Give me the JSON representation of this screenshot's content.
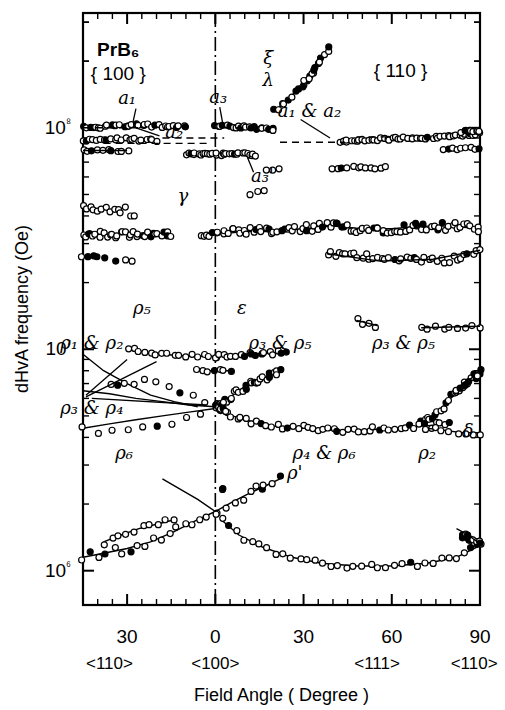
{
  "figure": {
    "title_material": "PrB₆",
    "plane_left": "{ 100 }",
    "plane_right": "{ 110 }",
    "xlabel": "Field Angle  ( Degree )",
    "ylabel": "dHvA frequency  (Oe)"
  },
  "chart_data": {
    "type": "scatter",
    "xlabel": "Field Angle  ( Degree )",
    "ylabel": "dHvA frequency  (Oe)",
    "yscale": "log",
    "ylim": [
      700000,
      330000000
    ],
    "ytick_labels": [
      "10⁸",
      "10⁷",
      "10⁶"
    ],
    "ytick_values": [
      100000000,
      10000000,
      1000000
    ],
    "grid": false,
    "legend": "none",
    "xaxis": {
      "panels": [
        {
          "name": "left",
          "from_deg": 45,
          "to_deg": 0,
          "direction_start": "<110>",
          "direction_end": "<100>"
        },
        {
          "name": "right",
          "from_deg": 0,
          "to_deg": 90,
          "direction_start": "<100>",
          "direction_end": "<110>"
        }
      ],
      "tick_labels": [
        "30",
        "0",
        "30",
        "60",
        "90"
      ],
      "tick_values": [
        -30,
        0,
        30,
        60,
        90
      ],
      "minor_tick_step_deg": 10,
      "direction_labels": [
        "<110>",
        "<100>",
        "<111>",
        "<110>"
      ],
      "center_line_deg": 0
    },
    "series": [
      {
        "name": "ξ",
        "label": "ξ",
        "branch": "xi",
        "points": [
          [
            30,
            155000000.0
          ],
          [
            33,
            175000000.0
          ],
          [
            35,
            195000000.0
          ],
          [
            37,
            215000000.0
          ],
          [
            39,
            230000000.0
          ]
        ]
      },
      {
        "name": "λ",
        "label": "λ",
        "branch": "lambda",
        "points": [
          [
            20,
            120000000.0
          ],
          [
            23,
            128000000.0
          ],
          [
            26,
            140000000.0
          ],
          [
            29,
            155000000.0
          ],
          [
            32,
            172000000.0
          ],
          [
            35,
            195000000.0
          ]
        ]
      },
      {
        "name": "a₁",
        "label": "a₁",
        "branch": "a1",
        "points": [
          [
            -45,
            100000000.0
          ],
          [
            -40,
            100000000.0
          ],
          [
            -35,
            102000000.0
          ],
          [
            -30,
            103000000.0
          ],
          [
            -25,
            103000000.0
          ],
          [
            -20,
            102000000.0
          ],
          [
            -15,
            102000000.0
          ],
          [
            -10,
            102000000.0
          ]
        ]
      },
      {
        "name": "a₂",
        "label": "a₂",
        "branch": "a2",
        "points": [
          [
            -45,
            88000000.0
          ],
          [
            -40,
            88000000.0
          ],
          [
            -35,
            89000000.0
          ],
          [
            -30,
            89000000.0
          ],
          [
            -25,
            88000000.0
          ],
          [
            -20,
            88000000.0
          ]
        ]
      },
      {
        "name": "a₃",
        "label": "a₃",
        "branch": "a3",
        "points": [
          [
            0,
            102000000.0
          ],
          [
            4,
            102000000.0
          ],
          [
            8,
            101000000.0
          ],
          [
            12,
            100000000.0
          ],
          [
            16,
            99000000.0
          ],
          [
            20,
            98000000.0
          ]
        ]
      },
      {
        "name": "a₃'",
        "label": "a₃'",
        "branch": "a3p",
        "points": [
          [
            -10,
            76000000.0
          ],
          [
            -6,
            76000000.0
          ],
          [
            -2,
            76000000.0
          ],
          [
            2,
            76000000.0
          ],
          [
            6,
            76000000.0
          ],
          [
            10,
            76000000.0
          ],
          [
            14,
            75000000.0
          ]
        ]
      },
      {
        "name": "a₁ & a₂",
        "label": "a₁ & a₂",
        "branch": "a1a2",
        "points": [
          [
            42,
            86000000.0
          ],
          [
            50,
            88000000.0
          ],
          [
            58,
            89000000.0
          ],
          [
            66,
            90000000.0
          ],
          [
            74,
            90000000.0
          ],
          [
            82,
            92000000.0
          ],
          [
            90,
            94000000.0
          ]
        ]
      },
      {
        "name": "γ",
        "label": "γ",
        "branch": "gamma",
        "points": [
          [
            -45,
            33000000.0
          ],
          [
            -35,
            33000000.0
          ],
          [
            -25,
            33000000.0
          ],
          [
            -15,
            33000000.0
          ],
          [
            -5,
            33000000.0
          ],
          [
            0,
            33000000.0
          ],
          [
            10,
            34000000.0
          ],
          [
            20,
            34000000.0
          ],
          [
            30,
            35000000.0
          ],
          [
            40,
            36000000.0
          ],
          [
            50,
            35000000.0
          ],
          [
            60,
            35000000.0
          ],
          [
            70,
            36000000.0
          ],
          [
            80,
            36000000.0
          ],
          [
            90,
            35000000.0
          ]
        ]
      },
      {
        "name": "ρ₁ & ρ₂",
        "label": "ρ₁ & ρ₂",
        "branch": "rho1rho2",
        "points": [
          [
            -45,
            9500000.0
          ],
          [
            -38,
            8000000.0
          ],
          [
            -30,
            7000000.0
          ],
          [
            -22,
            6200000.0
          ],
          [
            -14,
            5800000.0
          ],
          [
            -6,
            5500000.0
          ]
        ]
      },
      {
        "name": "ρ₃ & ρ₄",
        "label": "ρ₃ & ρ₄",
        "branch": "rho3rho4",
        "points": [
          [
            -45,
            6500000.0
          ],
          [
            -36,
            6300000.0
          ],
          [
            -27,
            6000000.0
          ],
          [
            -18,
            5800000.0
          ],
          [
            -9,
            5600000.0
          ],
          [
            0,
            5500000.0
          ]
        ]
      },
      {
        "name": "ρ₅",
        "label": "ρ₅",
        "branch": "rho5",
        "points": [
          [
            -30,
            10000000.0
          ],
          [
            -22,
            9600000.0
          ],
          [
            -14,
            9400000.0
          ],
          [
            -7,
            9300000.0
          ],
          [
            0,
            9300000.0
          ]
        ]
      },
      {
        "name": "ε",
        "label": "ε",
        "branch": "epsilon",
        "points": [
          [
            0,
            9300000.0
          ],
          [
            6,
            9400000.0
          ],
          [
            12,
            9500000.0
          ],
          [
            18,
            9600000.0
          ],
          [
            24,
            9700000.0
          ]
        ]
      },
      {
        "name": "ρ₃ & ρ₅ (mid)",
        "label": "ρ₃ & ρ₅",
        "branch": "rho3rho5_mid",
        "points": [
          [
            2,
            5600000.0
          ],
          [
            6,
            6200000.0
          ],
          [
            10,
            6800000.0
          ],
          [
            14,
            7200000.0
          ],
          [
            18,
            7600000.0
          ],
          [
            22,
            7900000.0
          ]
        ]
      },
      {
        "name": "ρ₃ & ρ₅ (right)",
        "label": "ρ₃ & ρ₅",
        "branch": "rho3rho5_right",
        "points": [
          [
            70,
            4600000.0
          ],
          [
            76,
            5200000.0
          ],
          [
            80,
            6000000.0
          ],
          [
            84,
            6800000.0
          ],
          [
            88,
            7500000.0
          ],
          [
            90,
            7800000.0
          ]
        ]
      },
      {
        "name": "ρ₆",
        "label": "ρ₆",
        "branch": "rho6",
        "points": [
          [
            -45,
            4400000.0
          ],
          [
            -36,
            4600000.0
          ],
          [
            -27,
            4800000.0
          ],
          [
            -18,
            5000000.0
          ],
          [
            -9,
            5200000.0
          ],
          [
            0,
            5400000.0
          ]
        ]
      },
      {
        "name": "ρ₄ & ρ₆",
        "label": "ρ₄ & ρ₆",
        "branch": "rho4rho6",
        "points": [
          [
            2,
            5200000.0
          ],
          [
            10,
            4800000.0
          ],
          [
            20,
            4500000.0
          ],
          [
            30,
            4400000.0
          ],
          [
            40,
            4300000.0
          ],
          [
            50,
            4300000.0
          ],
          [
            60,
            4400000.0
          ],
          [
            70,
            4500000.0
          ],
          [
            80,
            4600000.0
          ]
        ]
      },
      {
        "name": "ρ₂",
        "label": "ρ₂",
        "branch": "rho2",
        "points": [
          [
            72,
            4400000.0
          ],
          [
            78,
            4300000.0
          ],
          [
            84,
            4200000.0
          ],
          [
            90,
            4200000.0
          ]
        ]
      },
      {
        "name": "δ",
        "label": "δ",
        "branch": "delta",
        "points": [
          [
            82,
            6500000.0
          ],
          [
            85,
            7000000.0
          ],
          [
            88,
            7600000.0
          ],
          [
            90,
            7900000.0
          ]
        ]
      },
      {
        "name": "ρ' (left upper)",
        "label": "ρ'",
        "branch": "rhop_left_upper",
        "points": [
          [
            -38,
            1350000.0
          ],
          [
            -32,
            1450000.0
          ],
          [
            -26,
            1550000.0
          ],
          [
            -20,
            1620000.0
          ],
          [
            -14,
            1700000.0
          ]
        ]
      },
      {
        "name": "ρ' (left lower)",
        "label": "ρ'",
        "branch": "rhop_left_lower",
        "points": [
          [
            -45,
            1150000.0
          ],
          [
            -38,
            1200000.0
          ],
          [
            -30,
            1260000.0
          ],
          [
            -22,
            1350000.0
          ],
          [
            -14,
            1500000.0
          ],
          [
            -6,
            1700000.0
          ],
          [
            0,
            1850000.0
          ]
        ]
      },
      {
        "name": "ρ' (right rising)",
        "label": "ρ'",
        "branch": "rhop_right",
        "points": [
          [
            0,
            1850000.0
          ],
          [
            6,
            2050000.0
          ],
          [
            12,
            2250000.0
          ],
          [
            18,
            2450000.0
          ],
          [
            22,
            2600000.0
          ]
        ]
      },
      {
        "name": "ρ' (right falling)",
        "label": "ρ'",
        "branch": "rhop_fall",
        "points": [
          [
            2,
            1700000.0
          ],
          [
            8,
            1450000.0
          ],
          [
            16,
            1280000.0
          ],
          [
            26,
            1150000.0
          ],
          [
            36,
            1080000.0
          ],
          [
            48,
            1050000.0
          ],
          [
            60,
            1050000.0
          ],
          [
            72,
            1080000.0
          ],
          [
            82,
            1150000.0
          ],
          [
            90,
            1300000.0
          ]
        ]
      }
    ],
    "annotations": [
      {
        "text": "PrB₆",
        "x_deg": -33,
        "y": 210000000.0
      },
      {
        "text": "{ 100 }",
        "x_deg": -33,
        "y": 165000000.0
      },
      {
        "text": "{ 110 }",
        "x_deg": 63,
        "y": 170000000.0
      },
      {
        "text": "ξ",
        "x_deg": 18,
        "y": 195000000.0
      },
      {
        "text": "λ",
        "x_deg": 18,
        "y": 155000000.0
      },
      {
        "text": "a₁",
        "x_deg": -30,
        "y": 128000000.0
      },
      {
        "text": "a₃",
        "x_deg": 1,
        "y": 130000000.0
      },
      {
        "text": "a₂",
        "x_deg": -14,
        "y": 90000000.0
      },
      {
        "text": "a₁ & a₂",
        "x_deg": 32,
        "y": 112000000.0
      },
      {
        "text": "a₃'",
        "x_deg": 16,
        "y": 57000000.0
      },
      {
        "text": "γ",
        "x_deg": -11,
        "y": 46000000.0
      },
      {
        "text": "ρ₅",
        "x_deg": -25,
        "y": 14500000.0
      },
      {
        "text": "ε",
        "x_deg": 9,
        "y": 14500000.0
      },
      {
        "text": "ρ₁ & ρ₂",
        "x_deg": -42,
        "y": 10000000.0
      },
      {
        "text": "ρ₃ & ρ₅",
        "x_deg": 22,
        "y": 10000000.0
      },
      {
        "text": "ρ₃ & ρ₅",
        "x_deg": 64,
        "y": 10000000.0
      },
      {
        "text": "ρ₃ & ρ₄",
        "x_deg": -42,
        "y": 5100000.0
      },
      {
        "text": "ρ₆",
        "x_deg": -31,
        "y": 3200000.0
      },
      {
        "text": "ρ₄ & ρ₆",
        "x_deg": 37,
        "y": 3200000.0
      },
      {
        "text": "ρ₂",
        "x_deg": 72,
        "y": 3200000.0
      },
      {
        "text": "δ",
        "x_deg": 86,
        "y": 4000000.0
      },
      {
        "text": "ρ'",
        "x_deg": 27,
        "y": 2600000.0
      }
    ]
  }
}
